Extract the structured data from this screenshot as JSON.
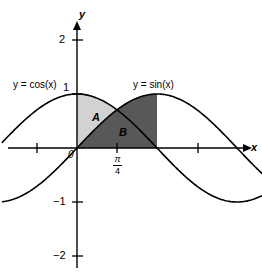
{
  "figure": {
    "width": 262,
    "height": 278,
    "background": "#ffffff"
  },
  "axes": {
    "x_axis_name": "x",
    "y_axis_name": "y",
    "origin_label": "0",
    "x_ticks": [
      {
        "label": "",
        "x": -0.7853981634
      },
      {
        "label": "",
        "x": 0.7853981634
      },
      {
        "label": "",
        "x": 2.3561944902
      }
    ],
    "x_tick_special": {
      "label_num": "π",
      "label_den": "4",
      "x": 0.7853981634
    },
    "y_ticks": [
      {
        "label": "2",
        "y": 2
      },
      {
        "label": "1",
        "y": 1
      },
      {
        "label": "−1",
        "y": -1
      },
      {
        "label": "−2",
        "y": -2
      }
    ]
  },
  "curve_labels": {
    "cos": "y = cos(x)",
    "sin": "y = sin(x)"
  },
  "regions": [
    {
      "name": "A",
      "label": "A",
      "color": "#d2d2d2",
      "description": "between cos and sin from 0 to pi/4"
    },
    {
      "name": "B",
      "label": "B",
      "color": "#585858",
      "description": "under sin from 0 to pi/2"
    }
  ],
  "colors": {
    "curve": "#000000",
    "axis": "#000000",
    "region_a": "#d2d2d2",
    "region_b": "#585858",
    "text": "#000000"
  },
  "chart_data": {
    "type": "line",
    "title": "",
    "xlabel": "x",
    "ylabel": "y",
    "xlim": [
      -1.475,
      4.2
    ],
    "ylim": [
      -2.32,
      2.35
    ],
    "grid": false,
    "legend": "inline-curve-labels",
    "series": [
      {
        "name": "y = cos(x)",
        "formula": "cos(x)",
        "x": [
          -1.475,
          -1.178,
          -0.884,
          -0.589,
          -0.295,
          0,
          0.295,
          0.589,
          0.785,
          0.884,
          1.178,
          1.473,
          1.571,
          1.767,
          2.062,
          2.356,
          2.651,
          2.945,
          3.142,
          3.24,
          3.534,
          3.829,
          4.123,
          4.2
        ],
        "y": [
          0.0957,
          0.3827,
          0.6344,
          0.8315,
          0.9568,
          1.0,
          0.9568,
          0.8315,
          0.7071,
          0.6344,
          0.3827,
          0.0978,
          0.0,
          -0.1951,
          -0.4818,
          -0.7071,
          -0.8819,
          -0.9808,
          -1.0,
          -0.9952,
          -0.9239,
          -0.7604,
          -0.5225,
          -0.4903
        ]
      },
      {
        "name": "y = sin(x)",
        "formula": "sin(x)",
        "x": [
          -1.475,
          -1.178,
          -0.884,
          -0.589,
          -0.295,
          0,
          0.295,
          0.589,
          0.785,
          0.884,
          1.178,
          1.473,
          1.571,
          1.767,
          2.062,
          2.356,
          2.651,
          2.945,
          3.142,
          3.24,
          3.534,
          3.829,
          4.123,
          4.2
        ],
        "y": [
          -0.9954,
          -0.9239,
          -0.773,
          -0.5556,
          -0.2907,
          0.0,
          0.2907,
          0.5556,
          0.7071,
          0.773,
          0.9239,
          0.9952,
          1.0,
          0.9808,
          0.8763,
          0.7071,
          0.4714,
          0.1951,
          0.0,
          -0.0978,
          -0.3827,
          -0.6494,
          -0.8266,
          -0.8716
        ]
      }
    ],
    "shaded_regions": [
      {
        "label": "A",
        "fill": "#d2d2d2",
        "x_from": 0,
        "x_to": 0.7853981634,
        "upper": "cos(x)",
        "lower": "sin(x)",
        "label_pos": {
          "x": 0.32,
          "y": 0.52
        }
      },
      {
        "label": "B",
        "fill": "#585858",
        "x_from": 0,
        "x_to": 1.5707963268,
        "upper": "sin(x)",
        "lower": "0",
        "label_pos": {
          "x": 0.79,
          "y": 0.29
        }
      }
    ],
    "annotations": [
      {
        "text": "y = cos(x)",
        "x": -1.1,
        "y": 1.32
      },
      {
        "text": "y = sin(x)",
        "x": 1.45,
        "y": 1.32
      },
      {
        "text": "A",
        "x": 0.32,
        "y": 0.52
      },
      {
        "text": "B",
        "x": 0.79,
        "y": 0.29
      },
      {
        "text": "0",
        "x": -0.09,
        "y": -0.12
      },
      {
        "text": "π/4",
        "x": 0.785,
        "y": -0.37
      }
    ]
  }
}
